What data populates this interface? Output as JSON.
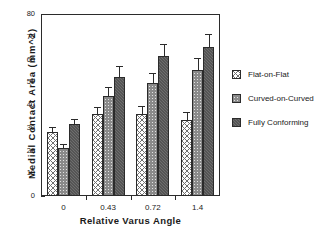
{
  "chart_data": {
    "type": "bar",
    "title": "",
    "xlabel": "Relative Varus Angle",
    "ylabel": "Medial  Contact  Area  (mm^2)",
    "categories": [
      "0",
      "0.43",
      "0.72",
      "1.4"
    ],
    "ylim": [
      0,
      80
    ],
    "yticks": [
      0,
      10,
      20,
      30,
      40,
      50,
      60,
      70,
      80
    ],
    "ytick_labels": [
      "0",
      "10",
      "20",
      "30",
      "40",
      "50",
      "60",
      "70",
      "80"
    ],
    "grid": false,
    "legend_position": "right",
    "series": [
      {
        "name": "Flat-on-Flat",
        "pattern": "cross-hatch-on-white",
        "color": "#ffffff",
        "values": [
          28.0,
          36.0,
          36.0,
          33.5
        ],
        "errors": [
          2.5,
          3.0,
          3.5,
          3.5
        ]
      },
      {
        "name": "Curved-on-Curved",
        "pattern": "fine-hatch-light-gray",
        "color": "#e2e2e2",
        "values": [
          21.0,
          44.0,
          49.5,
          55.5
        ],
        "errors": [
          2.0,
          4.0,
          4.5,
          5.0
        ]
      },
      {
        "name": "Fully Conforming",
        "pattern": "solid-dark-gray",
        "color": "#6e6e6e",
        "values": [
          31.5,
          52.5,
          61.5,
          65.5
        ],
        "errors": [
          2.5,
          4.5,
          5.5,
          5.5
        ]
      }
    ]
  },
  "legend": {
    "items": [
      {
        "label": "Flat-on-Flat"
      },
      {
        "label": "Curved-on-Curved"
      },
      {
        "label": "Fully Conforming"
      }
    ]
  },
  "axes": {
    "y_title": "Medial  Contact  Area  (mm^2)",
    "x_title": "Relative Varus Angle"
  }
}
